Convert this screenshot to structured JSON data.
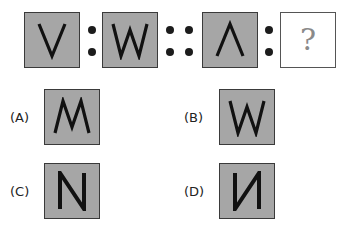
{
  "question": {
    "items": [
      {
        "id": "V",
        "glyph": "V"
      },
      {
        "id": "W",
        "glyph": "W"
      },
      {
        "id": "inverted-V",
        "glyph": "Λ"
      },
      {
        "id": "unknown",
        "glyph": "?"
      }
    ],
    "separators": [
      ":",
      "::",
      ":"
    ]
  },
  "options": [
    {
      "label": "(A)",
      "glyph": "M",
      "description": "inverted W"
    },
    {
      "label": "(B)",
      "glyph": "W",
      "description": "W"
    },
    {
      "label": "(C)",
      "glyph": "N",
      "description": "N"
    },
    {
      "label": "(D)",
      "glyph": "И",
      "description": "mirrored N"
    }
  ],
  "colors": {
    "tile_fill": "#a6a6a6",
    "tile_border": "#3a3a3a",
    "glyph": "#111111",
    "question_mark": "#8a8a8a"
  }
}
